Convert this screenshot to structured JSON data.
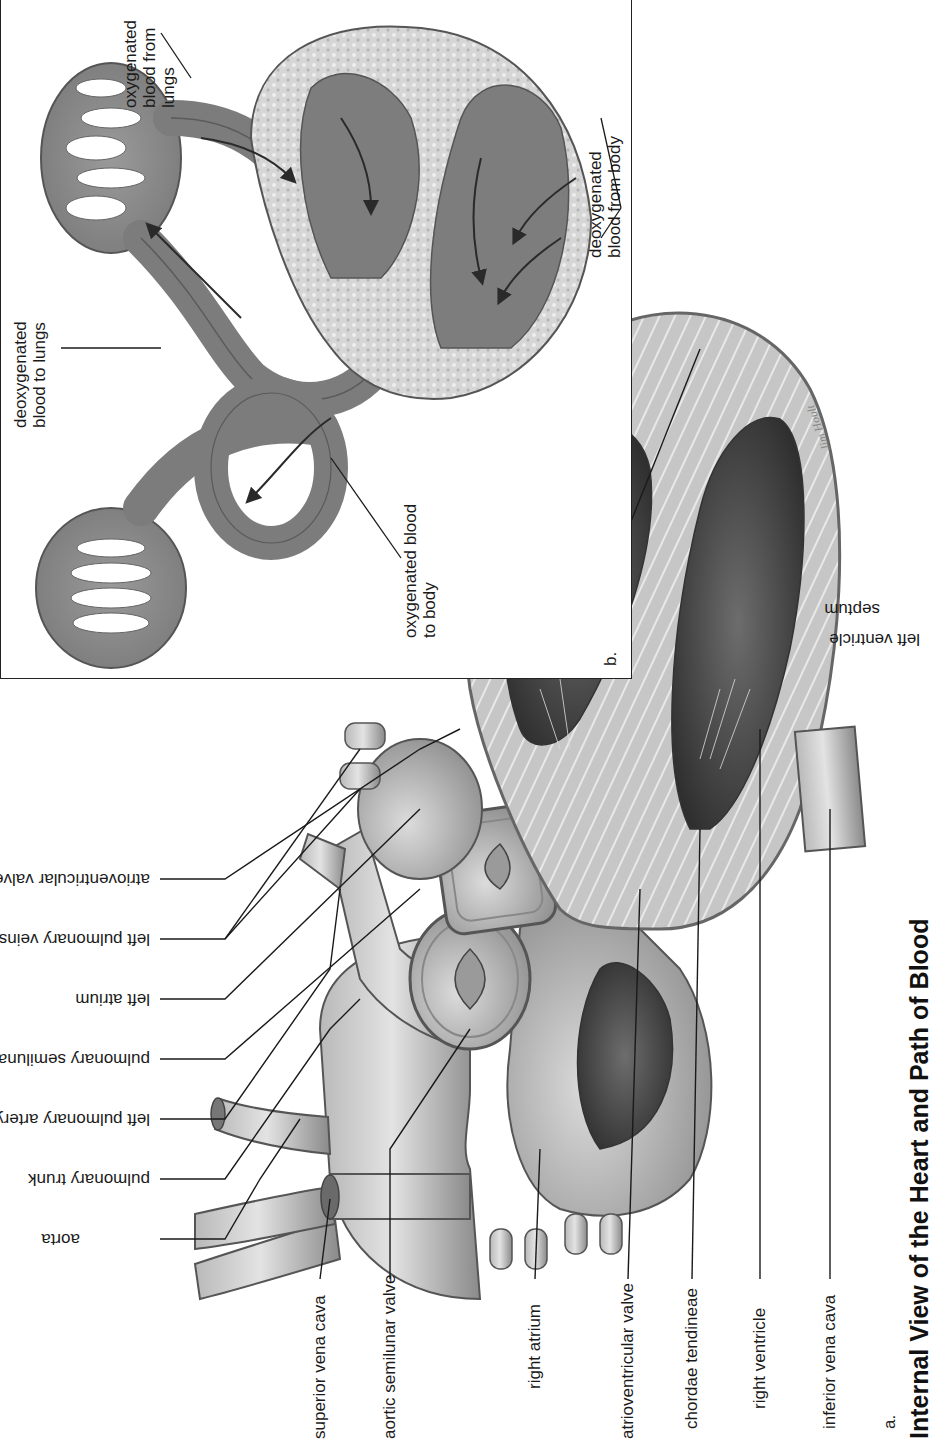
{
  "figure": {
    "title": "Internal View of the Heart and Path of Blood",
    "panel_a": {
      "letter": "a.",
      "labels_left": [
        "superior vena cava",
        "aortic semilunar valve",
        "right atrium",
        "atrioventricular valve",
        "chordae tendineae",
        "right ventricle",
        "inferior vena cava"
      ],
      "labels_top": [
        "aorta",
        "pulmonary trunk",
        "left pulmonary artery",
        "pulmonary semilunar valve",
        "left atrium",
        "left pulmonary veins",
        "atrioventricular valve"
      ],
      "labels_bottom": [
        "septum",
        "left ventricle"
      ],
      "signature": "Jim Hoult"
    },
    "panel_b": {
      "letter": "b.",
      "labels": {
        "deoxy_to_lungs": [
          "deoxygenated",
          "blood to lungs"
        ],
        "oxy_from_lungs": [
          "oxygenated",
          "blood from",
          "lungs"
        ],
        "oxy_to_body": [
          "oxygenated blood",
          "to body"
        ],
        "deoxy_from_body": [
          "deoxygenated",
          "blood from body"
        ]
      }
    },
    "colors": {
      "ink": "#1a1a1a",
      "tissue_gray": "#8f8f8f",
      "dark_chamber": "#3c3c3c",
      "muscle_light": "#c8c8c8",
      "vessel_b": "#8a8a8a"
    }
  }
}
